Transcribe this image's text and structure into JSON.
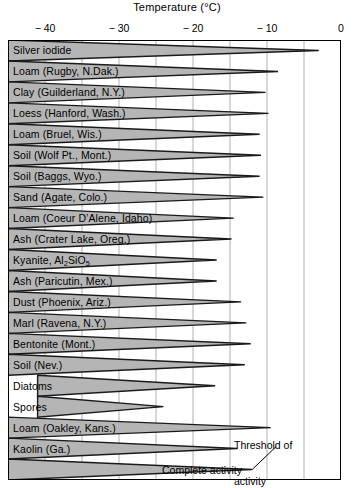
{
  "chart_data": {
    "type": "bar",
    "title": "Temperature (°C)",
    "xlabel": "Temperature (°C)",
    "ylabel": "",
    "xlim": [
      -45,
      0
    ],
    "xticks": [
      -40,
      -30,
      -20,
      -10,
      0
    ],
    "xtick_labels": [
      "− 40",
      "− 30",
      "− 20",
      "− 10",
      "0"
    ],
    "gridlines": [
      -40,
      -35,
      -30,
      -25,
      -20,
      -15,
      -10,
      -5
    ],
    "grid": true,
    "legend_position": "none",
    "note": "Each wedge spans from the 'complete activity' temperature (thick left end) to the 'threshold of activity' temperature (pointed right tip) for each ice-nucleating substance.",
    "series": [
      {
        "name": "complete_activity",
        "label": "Complete activity"
      },
      {
        "name": "threshold_of_activity",
        "label": "Threshold of activity"
      }
    ],
    "categories": [
      "Silver iodide",
      "Loam (Rugby, N.Dak.)",
      "Clay (Guilderland, N.Y.)",
      "Loess (Hanford, Wash.)",
      "Loam (Bruel, Wis.)",
      "Soil (Wolf Pt., Mont.)",
      "Soil (Baggs, Wyo.)",
      "Sand (Agate, Colo.)",
      "Loam (Coeur D'Alene, Idaho)",
      "Ash (Crater Lake, Oreg.)",
      "Kyanite, Al2SiO5",
      "Ash (Paricutin, Mex.)",
      "Dust (Phoenix, Ariz.)",
      "Marl (Ravena, N.Y.)",
      "Bentonite (Mont.)",
      "Soil (Nev.)",
      "Diatoms",
      "Spores",
      "Loam (Oakley, Kans.)",
      "Kaolin (Ga.)",
      ""
    ],
    "rows": [
      {
        "label": "Silver iodide",
        "label_html": "Silver iodide",
        "complete": -45.0,
        "threshold": -3.0
      },
      {
        "label": "Loam (Rugby, N.Dak.)",
        "label_html": "Loam (Rugby, N.Dak.)",
        "complete": -45.0,
        "threshold": -8.5
      },
      {
        "label": "Clay (Guilderland, N.Y.)",
        "label_html": "Clay (Guilderland, N.Y.)",
        "complete": -45.0,
        "threshold": -10.2
      },
      {
        "label": "Loess (Hanford, Wash.)",
        "label_html": "Loess (Hanford, Wash.)",
        "complete": -45.0,
        "threshold": -9.8
      },
      {
        "label": "Loam (Bruel, Wis.)",
        "label_html": "Loam (Bruel, Wis.)",
        "complete": -45.0,
        "threshold": -11.0
      },
      {
        "label": "Soil (Wolf Pt., Mont.)",
        "label_html": "Soil (Wolf Pt., Mont.)",
        "complete": -45.0,
        "threshold": -10.8
      },
      {
        "label": "Soil (Baggs, Wyo.)",
        "label_html": "Soil (Baggs, Wyo.)",
        "complete": -45.0,
        "threshold": -11.0
      },
      {
        "label": "Sand (Agate, Colo.)",
        "label_html": "Sand (Agate, Colo.)",
        "complete": -45.0,
        "threshold": -10.5
      },
      {
        "label": "Loam (Coeur D'Alene, Idaho)",
        "label_html": "Loam (Coeur D’Alene, Idaho)",
        "complete": -45.0,
        "threshold": -14.5
      },
      {
        "label": "Ash (Crater Lake, Oreg.)",
        "label_html": "Ash (Crater Lake, Oreg.)",
        "complete": -45.0,
        "threshold": -14.8
      },
      {
        "label": "Kyanite, Al2SiO5",
        "label_html": "Kyanite, Al<sub>2</sub>SiO<sub>5</sub>",
        "complete": -45.0,
        "threshold": -16.8
      },
      {
        "label": "Ash (Paricutin, Mex.)",
        "label_html": "Ash (Paricutin, Mex.)",
        "complete": -45.0,
        "threshold": -16.8
      },
      {
        "label": "Dust (Phoenix, Ariz.)",
        "label_html": "Dust (Phoenix, Ariz.)",
        "complete": -45.0,
        "threshold": -13.5
      },
      {
        "label": "Marl (Ravena, N.Y.)",
        "label_html": "Marl (Ravena, N.Y.)",
        "complete": -45.0,
        "threshold": -12.8
      },
      {
        "label": "Bentonite (Mont.)",
        "label_html": "Bentonite (Mont.)",
        "complete": -45.0,
        "threshold": -12.2
      },
      {
        "label": "Soil (Nev.)",
        "label_html": "Soil (Nev.)",
        "complete": -45.0,
        "threshold": -13.0
      },
      {
        "label": "Diatoms",
        "label_html": "Diatoms",
        "complete": -41.0,
        "threshold": -17.0
      },
      {
        "label": "Spores",
        "label_html": "Spores",
        "complete": -41.0,
        "threshold": -24.0
      },
      {
        "label": "Loam (Oakley, Kans.)",
        "label_html": "Loam (Oakley, Kans.)",
        "complete": -45.0,
        "threshold": -9.5
      },
      {
        "label": "Kaolin (Ga.)",
        "label_html": "Kaolin (Ga.)",
        "complete": -45.0,
        "threshold": -14.0
      },
      {
        "label": "",
        "label_html": "",
        "complete": -45.0,
        "threshold": -12.0
      }
    ]
  },
  "annotations": {
    "threshold": {
      "line1": "Threshold of",
      "line2": "activity"
    },
    "complete": {
      "line1": "Complete activity"
    }
  },
  "style": {
    "wedge_fill": "#b5b5b5",
    "wedge_stroke": "#1a1a1a",
    "grid_color": "#b0b0b0",
    "frame_color": "#000000",
    "text_color": "#000000"
  }
}
